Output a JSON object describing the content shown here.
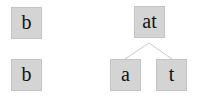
{
  "diagram": {
    "left_column": {
      "top_node": {
        "label": "b"
      },
      "bottom_node": {
        "label": "b"
      }
    },
    "tree": {
      "root": {
        "label": "at"
      },
      "children": [
        {
          "label": "a"
        },
        {
          "label": "t"
        }
      ]
    },
    "colors": {
      "node_fill": "#d4d4d4",
      "node_border": "#c4c4c4",
      "edge": "#c8c8c8",
      "text": "#111111"
    }
  }
}
